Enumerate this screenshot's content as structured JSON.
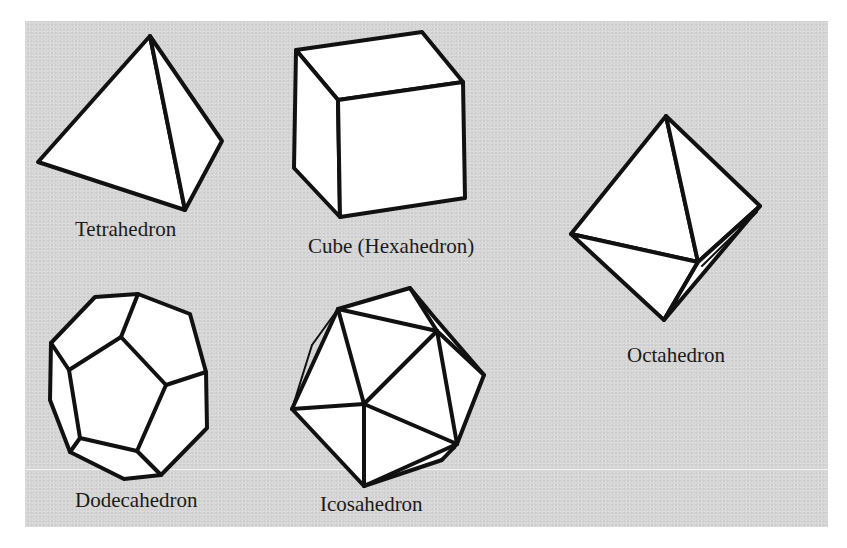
{
  "figure": {
    "background_color": "#d6d6d6",
    "stroke_color": "#111111",
    "fill_color": "#ffffff",
    "shapes": [
      {
        "id": "tetrahedron",
        "label": "Tetrahedron"
      },
      {
        "id": "cube",
        "label": "Cube (Hexahedron)"
      },
      {
        "id": "octahedron",
        "label": "Octahedron"
      },
      {
        "id": "dodecahedron",
        "label": "Dodecahedron"
      },
      {
        "id": "icosahedron",
        "label": "Icosahedron"
      }
    ]
  }
}
